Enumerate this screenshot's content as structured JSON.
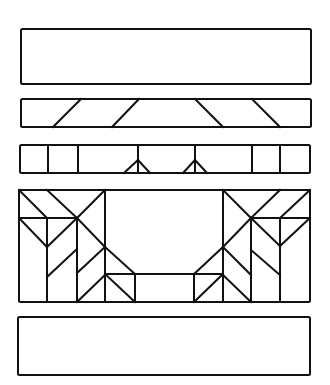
{
  "diagram": {
    "stroke_color": "#111111",
    "background_color": "#ffffff",
    "stroke_width": 2,
    "panels": [
      {
        "id": "panel-1-plain",
        "rect": {
          "x": 21,
          "y": 29,
          "w": 290,
          "h": 55
        },
        "lines": []
      },
      {
        "id": "panel-2-diagonals",
        "rect": {
          "x": 21,
          "y": 99,
          "w": 290,
          "h": 28
        },
        "lines": [
          [
            53,
            127,
            81,
            99
          ],
          [
            112,
            127,
            139,
            99
          ],
          [
            195,
            99,
            223,
            127
          ],
          [
            252,
            99,
            280,
            127
          ]
        ]
      },
      {
        "id": "panel-3-verticals-arrows",
        "rect": {
          "x": 20,
          "y": 145,
          "w": 290,
          "h": 28
        },
        "lines": [
          [
            48,
            145,
            48,
            173
          ],
          [
            78,
            145,
            78,
            173
          ],
          [
            138,
            145,
            138,
            173
          ],
          [
            124,
            173,
            138,
            160
          ],
          [
            138,
            160,
            150,
            173
          ],
          [
            195,
            145,
            195,
            173
          ],
          [
            183,
            173,
            195,
            160
          ],
          [
            195,
            160,
            207,
            173
          ],
          [
            252,
            145,
            252,
            173
          ],
          [
            280,
            145,
            280,
            173
          ]
        ]
      },
      {
        "id": "panel-4-geometric",
        "rect": {
          "x": 19,
          "y": 190,
          "w": 291,
          "h": 112
        },
        "lines": [
          [
            19,
            190,
            47,
            218
          ],
          [
            47,
            190,
            77,
            218
          ],
          [
            105,
            190,
            77,
            218
          ],
          [
            19,
            218,
            77,
            218
          ],
          [
            19,
            218,
            47,
            247
          ],
          [
            47,
            247,
            77,
            218
          ],
          [
            47,
            218,
            47,
            302
          ],
          [
            77,
            218,
            77,
            302
          ],
          [
            105,
            190,
            105,
            302
          ],
          [
            77,
            218,
            105,
            247
          ],
          [
            105,
            247,
            135,
            274
          ],
          [
            47,
            277,
            77,
            249
          ],
          [
            77,
            273,
            105,
            247
          ],
          [
            77,
            302,
            105,
            275
          ],
          [
            105,
            274,
            223,
            274
          ],
          [
            105,
            274,
            135,
            302
          ],
          [
            135,
            274,
            135,
            302
          ],
          [
            194,
            274,
            194,
            302
          ],
          [
            223,
            274,
            194,
            302
          ],
          [
            223,
            190,
            223,
            302
          ],
          [
            223,
            247,
            194,
            274
          ],
          [
            223,
            190,
            251,
            218
          ],
          [
            280,
            190,
            251,
            218
          ],
          [
            310,
            190,
            280,
            218
          ],
          [
            251,
            218,
            310,
            218
          ],
          [
            251,
            218,
            280,
            246
          ],
          [
            280,
            246,
            310,
            218
          ],
          [
            251,
            218,
            251,
            302
          ],
          [
            280,
            218,
            280,
            302
          ],
          [
            251,
            218,
            223,
            247
          ],
          [
            223,
            247,
            251,
            275
          ],
          [
            251,
            250,
            280,
            275
          ],
          [
            223,
            275,
            251,
            302
          ]
        ]
      },
      {
        "id": "panel-5-plain",
        "rect": {
          "x": 18,
          "y": 317,
          "w": 292,
          "h": 58
        },
        "lines": []
      }
    ]
  }
}
